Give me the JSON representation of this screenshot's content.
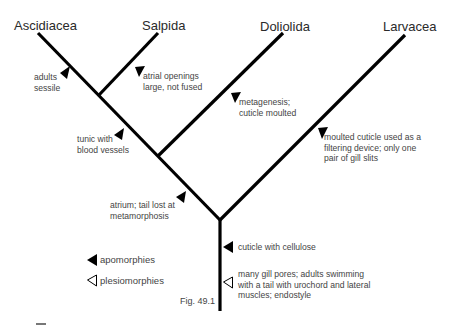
{
  "taxa": [
    {
      "name": "Ascidiacea"
    },
    {
      "name": "Salpida"
    },
    {
      "name": "Doliolida"
    },
    {
      "name": "Larvacea"
    }
  ],
  "characters": [
    {
      "text": "adults\nsessile",
      "type": "apomorphy",
      "branch": "Ascidiacea"
    },
    {
      "text": "atrial openings\nlarge, not fused",
      "type": "apomorphy",
      "branch": "Salpida"
    },
    {
      "text": "tunic with\nblood vessels",
      "type": "apomorphy",
      "branch": "Ascidiacea+Salpida"
    },
    {
      "text": "metagenesis;\ncuticle moulted",
      "type": "apomorphy",
      "branch": "Doliolida"
    },
    {
      "text": "atrium; tail lost at\nmetamorphosis",
      "type": "apomorphy",
      "branch": "Ascidiacea+Salpida+Doliolida"
    },
    {
      "text": "moulted cuticle used as a\nfiltering device; only one\npair of gill slits",
      "type": "apomorphy",
      "branch": "Larvacea"
    },
    {
      "text": "cuticle with cellulose",
      "type": "apomorphy",
      "branch": "root"
    },
    {
      "text": "many gill pores; adults swimming\nwith a tail with urochord and lateral\nmuscles; endostyle",
      "type": "plesiomorphy",
      "branch": "root"
    }
  ],
  "legend": {
    "apomorphies": "apomorphies",
    "plesiomorphies": "plesiomorphies"
  },
  "figure_label": "Fig. 49.1",
  "colors": {
    "line": "#000000",
    "text": "#444444",
    "background": "#ffffff"
  }
}
